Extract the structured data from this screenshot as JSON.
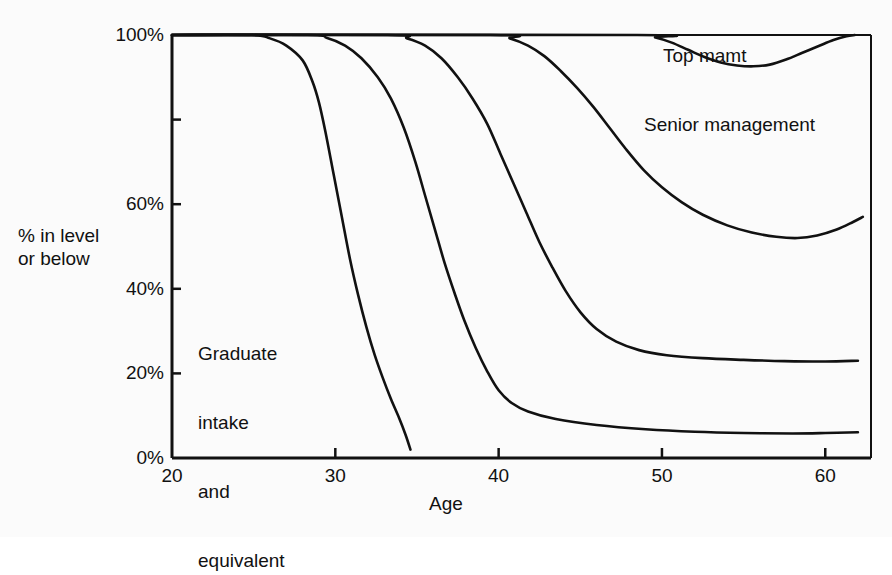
{
  "chart_data": {
    "type": "line",
    "title": "",
    "subtitle": "",
    "xlabel": "Age",
    "ylabel": "% in level\nor below",
    "ylabel_line1": "% in level",
    "ylabel_line2": "or below",
    "xlim": [
      20,
      62.8
    ],
    "ylim": [
      0,
      100
    ],
    "grid": false,
    "legend_position": "inline-annotations",
    "xticks": [
      20,
      30,
      40,
      50,
      60
    ],
    "xtick_labels": [
      "20",
      "30",
      "40",
      "50",
      "60"
    ],
    "yticks": [
      0,
      20,
      40,
      60,
      80,
      100
    ],
    "ytick_labels": [
      "0%",
      "20%",
      "40%",
      "60%",
      "",
      "100%"
    ],
    "ytick_labels_visible": [
      "0%",
      "20%",
      "40%",
      "60%",
      "100%"
    ],
    "annotations": [
      {
        "id": "top-mgmt",
        "text": "Top mamt",
        "x": 53.0,
        "y": 92
      },
      {
        "id": "senior-management",
        "text": "Senior management",
        "x": 52.0,
        "y": 76
      },
      {
        "id": "graduate-intake",
        "text": "Graduate\nintake\nand\nequivalent",
        "x": 21.6,
        "y": 36
      }
    ],
    "annotation_graduate_lines": [
      "Graduate",
      "intake",
      "and",
      "equivalent"
    ],
    "series": [
      {
        "name": "Graduate intake and equivalent",
        "points": [
          [
            20.0,
            100
          ],
          [
            24.9,
            100
          ],
          [
            26.0,
            99.2
          ],
          [
            27.0,
            97.5
          ],
          [
            28.0,
            94.0
          ],
          [
            28.6,
            89.0
          ],
          [
            29.0,
            84.0
          ],
          [
            29.4,
            77.0
          ],
          [
            29.9,
            67.0
          ],
          [
            30.4,
            57.0
          ],
          [
            30.9,
            47.0
          ],
          [
            31.4,
            38.5
          ],
          [
            31.9,
            31.0
          ],
          [
            32.4,
            24.5
          ],
          [
            32.9,
            19.0
          ],
          [
            33.4,
            14.0
          ],
          [
            33.9,
            9.5
          ],
          [
            34.3,
            5.5
          ],
          [
            34.6,
            2.0
          ]
        ]
      },
      {
        "name": "Second level",
        "points": [
          [
            20.0,
            100
          ],
          [
            28.3,
            100
          ],
          [
            29.5,
            99.3
          ],
          [
            30.6,
            97.5
          ],
          [
            31.6,
            94.5
          ],
          [
            32.6,
            90.0
          ],
          [
            33.4,
            85.0
          ],
          [
            34.2,
            78.0
          ],
          [
            34.9,
            70.0
          ],
          [
            35.5,
            62.0
          ],
          [
            36.1,
            54.0
          ],
          [
            36.7,
            46.0
          ],
          [
            37.3,
            39.0
          ],
          [
            37.9,
            32.5
          ],
          [
            38.6,
            26.0
          ],
          [
            39.3,
            20.5
          ],
          [
            40.0,
            16.0
          ],
          [
            40.8,
            13.0
          ],
          [
            41.8,
            11.0
          ],
          [
            43.5,
            9.2
          ],
          [
            46.0,
            7.8
          ],
          [
            49.0,
            6.8
          ],
          [
            52.0,
            6.2
          ],
          [
            55.0,
            5.9
          ],
          [
            58.0,
            5.8
          ],
          [
            60.0,
            5.9
          ],
          [
            62.0,
            6.1
          ]
        ]
      },
      {
        "name": "Third level",
        "points": [
          [
            20.0,
            100
          ],
          [
            33.2,
            100
          ],
          [
            34.4,
            99.2
          ],
          [
            35.5,
            97.5
          ],
          [
            36.5,
            94.5
          ],
          [
            37.5,
            90.0
          ],
          [
            38.4,
            85.0
          ],
          [
            39.3,
            79.0
          ],
          [
            40.1,
            72.0
          ],
          [
            40.9,
            65.0
          ],
          [
            41.7,
            58.0
          ],
          [
            42.5,
            51.0
          ],
          [
            43.3,
            45.0
          ],
          [
            44.1,
            39.5
          ],
          [
            45.0,
            34.5
          ],
          [
            46.0,
            30.5
          ],
          [
            47.2,
            27.5
          ],
          [
            48.6,
            25.5
          ],
          [
            50.3,
            24.3
          ],
          [
            52.5,
            23.6
          ],
          [
            55.0,
            23.2
          ],
          [
            57.5,
            22.9
          ],
          [
            60.0,
            22.8
          ],
          [
            62.0,
            23.0
          ]
        ]
      },
      {
        "name": "Senior management",
        "points": [
          [
            20.0,
            100
          ],
          [
            39.5,
            100
          ],
          [
            40.7,
            99.2
          ],
          [
            41.8,
            97.5
          ],
          [
            42.8,
            95.0
          ],
          [
            43.8,
            91.5
          ],
          [
            44.8,
            87.5
          ],
          [
            45.8,
            83.0
          ],
          [
            46.8,
            78.0
          ],
          [
            47.8,
            73.0
          ],
          [
            48.9,
            68.0
          ],
          [
            50.0,
            64.0
          ],
          [
            51.2,
            60.5
          ],
          [
            52.5,
            57.5
          ],
          [
            54.0,
            55.0
          ],
          [
            55.5,
            53.3
          ],
          [
            57.0,
            52.3
          ],
          [
            58.3,
            52.0
          ],
          [
            59.5,
            52.6
          ],
          [
            60.7,
            54.0
          ],
          [
            61.7,
            55.8
          ],
          [
            62.3,
            57.0
          ]
        ]
      },
      {
        "name": "Top mamt",
        "points": [
          [
            20.0,
            100
          ],
          [
            48.5,
            100
          ],
          [
            49.6,
            99.4
          ],
          [
            50.6,
            98.2
          ],
          [
            51.6,
            96.5
          ],
          [
            52.6,
            94.8
          ],
          [
            53.6,
            93.5
          ],
          [
            54.6,
            92.8
          ],
          [
            55.6,
            92.6
          ],
          [
            56.6,
            93.0
          ],
          [
            57.6,
            94.2
          ],
          [
            58.6,
            95.8
          ],
          [
            59.6,
            97.4
          ],
          [
            60.5,
            98.8
          ],
          [
            61.3,
            99.7
          ],
          [
            61.8,
            100
          ]
        ]
      }
    ]
  },
  "plot_geometry": {
    "left": 172,
    "right": 871,
    "top": 35,
    "bottom": 458
  },
  "colors": {
    "line": "#111111",
    "axis": "#111111",
    "background": "#fbfbfb",
    "text": "#111111"
  }
}
